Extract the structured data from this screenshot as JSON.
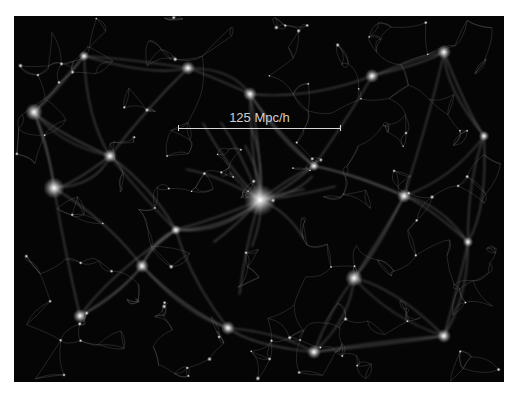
{
  "image": {
    "description": "Cosmic web large-scale structure simulation",
    "background": "#050505",
    "filament_color": "#cfcfcf"
  },
  "scale_bar": {
    "label": "125 Mpc/h"
  },
  "nodes": [
    {
      "x": 246,
      "y": 184,
      "r": 9
    },
    {
      "x": 40,
      "y": 172,
      "r": 6
    },
    {
      "x": 20,
      "y": 96,
      "r": 5
    },
    {
      "x": 96,
      "y": 140,
      "r": 4
    },
    {
      "x": 174,
      "y": 52,
      "r": 4
    },
    {
      "x": 236,
      "y": 78,
      "r": 4
    },
    {
      "x": 358,
      "y": 60,
      "r": 4
    },
    {
      "x": 430,
      "y": 36,
      "r": 4
    },
    {
      "x": 390,
      "y": 180,
      "r": 4
    },
    {
      "x": 340,
      "y": 262,
      "r": 5
    },
    {
      "x": 454,
      "y": 226,
      "r": 3
    },
    {
      "x": 128,
      "y": 250,
      "r": 4
    },
    {
      "x": 66,
      "y": 300,
      "r": 4
    },
    {
      "x": 214,
      "y": 312,
      "r": 4
    },
    {
      "x": 300,
      "y": 336,
      "r": 4
    },
    {
      "x": 430,
      "y": 320,
      "r": 4
    },
    {
      "x": 162,
      "y": 214,
      "r": 3
    },
    {
      "x": 300,
      "y": 150,
      "r": 3
    },
    {
      "x": 70,
      "y": 40,
      "r": 3
    },
    {
      "x": 470,
      "y": 120,
      "r": 3
    }
  ]
}
